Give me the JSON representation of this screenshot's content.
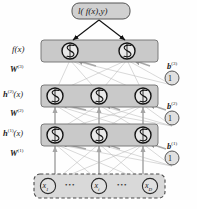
{
  "figure": {
    "colors": {
      "layer_band_fill": "#c9c9c9",
      "layer_band_stroke": "#6f6f6f",
      "loss_box_fill": "#d0d0d0",
      "loss_box_stroke": "#555555",
      "input_band_fill": "#d9d9d9",
      "input_dash_stroke": "#4a4a4a",
      "neuron_fill": "#e8e8e8",
      "neuron_stroke": "#1a1a1a",
      "bias_fill": "#e0e0e0",
      "bias_stroke": "#555555",
      "edge_color": "#b2b2b2",
      "arrow_dark": "#111111",
      "text_color": "#1a1a1a",
      "background": "#ffffff"
    },
    "loss_node": {
      "label": "l( f(x),y)",
      "text_plain": "l(f(x),y)"
    },
    "left_labels": [
      {
        "id": "output-label",
        "text": "f(x)",
        "base": "f",
        "sup": "",
        "tail": "(x)"
      },
      {
        "id": "weights-3",
        "text": "W(3)",
        "base": "W",
        "sup": "(3)",
        "tail": ""
      },
      {
        "id": "hidden2-label",
        "text": "h(2)(x)",
        "base": "h",
        "sup": "(2)",
        "tail": "(x)"
      },
      {
        "id": "weights-2",
        "text": "W(2)",
        "base": "W",
        "sup": "(2)",
        "tail": ""
      },
      {
        "id": "hidden1-label",
        "text": "h(1)(x)",
        "base": "h",
        "sup": "(1)",
        "tail": "(x)"
      },
      {
        "id": "weights-1",
        "text": "W(1)",
        "base": "W",
        "sup": "(1)",
        "tail": ""
      }
    ],
    "bias_labels": [
      {
        "id": "bias-3",
        "base": "b",
        "sup": "(3)",
        "value": "1"
      },
      {
        "id": "bias-2",
        "base": "b",
        "sup": "(2)",
        "value": "1"
      },
      {
        "id": "bias-1",
        "base": "b",
        "sup": "(1)",
        "value": "1"
      }
    ],
    "layers": [
      {
        "id": "output-layer",
        "name": "f(x)",
        "neuron_count": 2,
        "glyph": "sigmoid"
      },
      {
        "id": "hidden-layer-2",
        "name": "h(2)(x)",
        "neuron_count": 3,
        "glyph": "sigmoid"
      },
      {
        "id": "hidden-layer-1",
        "name": "h(1)(x)",
        "neuron_count": 3,
        "glyph": "sigmoid"
      },
      {
        "id": "input-layer",
        "name": "x",
        "neuron_count": 3,
        "glyph": "variable"
      }
    ],
    "input_nodes": [
      {
        "base": "x",
        "sub": "1"
      },
      {
        "base": "x",
        "sub": "i"
      },
      {
        "base": "x",
        "sub": "D"
      }
    ],
    "input_ellipses": [
      "•••",
      "•••"
    ],
    "neuron_glyph": "sigmoid-S-curve",
    "caption": ""
  }
}
